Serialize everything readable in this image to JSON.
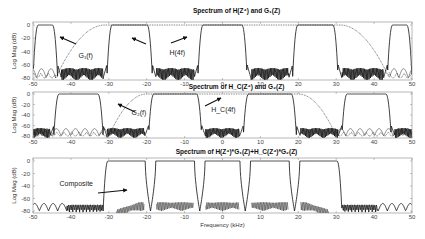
{
  "chart_data": [
    {
      "type": "line",
      "title": "Spectrum of H(Z⁴) and G₁(Z)",
      "xlabel": "",
      "ylabel": "Log Mag (dB)",
      "xlim": [
        -50,
        50
      ],
      "ylim": [
        -80,
        5
      ],
      "xticks": [
        -50,
        -40,
        -30,
        -20,
        -10,
        0,
        10,
        20,
        30,
        40,
        50
      ],
      "yticks": [
        0,
        -20,
        -40,
        -60,
        -80
      ],
      "series": [
        {
          "name": "H(4f)",
          "style": "solid",
          "passbands": [
            [
              -50,
              -43.5
            ],
            [
              -30.5,
              -18.5
            ],
            [
              -6.5,
              6.5
            ],
            [
              18.5,
              30.5
            ],
            [
              43.5,
              50
            ]
          ],
          "stopband_level": -65
        },
        {
          "name": "G1(f)",
          "style": "dotted",
          "passband": [
            -31,
            31
          ],
          "transition_to": 44,
          "stopband_level": -75
        }
      ],
      "annotations": [
        {
          "text": "G₁(f)",
          "x": -38,
          "y": -50
        },
        {
          "text": "H(4f)",
          "x": -14,
          "y": -45
        }
      ]
    },
    {
      "type": "line",
      "title": "Spectrum of H_C(Z⁴) and G₂(Z)",
      "xlabel": "",
      "ylabel": "Log Mag (dB)",
      "xlim": [
        -50,
        50
      ],
      "ylim": [
        -80,
        5
      ],
      "xticks": [
        -50,
        -40,
        -30,
        -20,
        -10,
        0,
        10,
        20,
        30,
        40,
        50
      ],
      "yticks": [
        0,
        -20,
        -40,
        -60,
        -80
      ],
      "series": [
        {
          "name": "H_C(4f)",
          "style": "solid",
          "passbands": [
            [
              -44.5,
              -31.5
            ],
            [
              -19.5,
              -5.5
            ],
            [
              5.5,
              19.5
            ],
            [
              31.5,
              44.5
            ]
          ],
          "stopband_level": -65
        },
        {
          "name": "G2(f)",
          "style": "dotted",
          "passband": [
            -20,
            20
          ],
          "transition_to": 30,
          "stopband_level": -75
        }
      ],
      "annotations": [
        {
          "text": "G₂(f)",
          "x": -24,
          "y": -40
        },
        {
          "text": "H_C(4f)",
          "x": -3,
          "y": -35
        }
      ]
    },
    {
      "type": "line",
      "title": "Spectrum of H(Z⁴)*G₁(Z)+H_C(Z⁴)*G₂(Z)",
      "xlabel": "Frequency (kHz)",
      "ylabel": "Log Mag (dB)",
      "xlim": [
        -50,
        50
      ],
      "ylim": [
        -80,
        5
      ],
      "xticks": [
        -50,
        -40,
        -30,
        -20,
        -10,
        0,
        10,
        20,
        30,
        40,
        50
      ],
      "yticks": [
        0,
        -20,
        -40,
        -60,
        -80
      ],
      "series": [
        {
          "name": "Composite",
          "style": "solid",
          "passband": [
            -31.5,
            31.5
          ],
          "notches": [
            -19,
            -6,
            6,
            19
          ],
          "stopband_level": -70
        }
      ],
      "annotations": [
        {
          "text": "Composite",
          "x": -43,
          "y": -40
        }
      ]
    }
  ],
  "layout": {
    "plot_left": 33,
    "plot_right": 412,
    "panels": [
      {
        "box_top": 22,
        "zero_y": 25,
        "m80_y": 78,
        "box_bottom": 80,
        "title_y": 13,
        "tick_y": 86
      },
      {
        "box_top": 92,
        "zero_y": 94,
        "m80_y": 136,
        "box_bottom": 138,
        "title_y": 89,
        "tick_y": 144
      },
      {
        "box_top": 158,
        "zero_y": 161,
        "m80_y": 211,
        "box_bottom": 213,
        "title_y": 154,
        "tick_y": 219
      }
    ],
    "xlabel_y": 227
  }
}
